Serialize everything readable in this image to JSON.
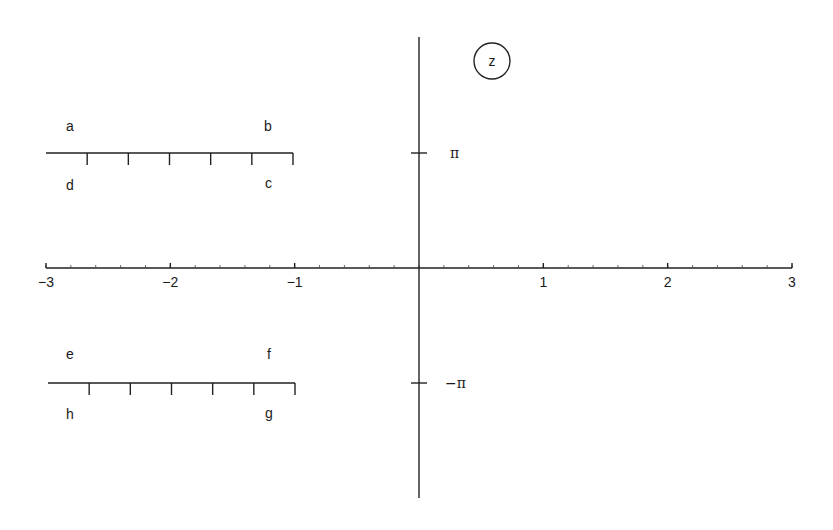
{
  "plane_label": "z",
  "x_axis": {
    "ticks": [
      {
        "value": -3,
        "label": "−3",
        "x": 46
      },
      {
        "value": -2,
        "label": "−2",
        "x": 170
      },
      {
        "value": -1,
        "label": "−1",
        "x": 294
      },
      {
        "value": 1,
        "label": "1",
        "x": 543
      },
      {
        "value": 2,
        "label": "2",
        "x": 668
      },
      {
        "value": 3,
        "label": "3",
        "x": 792
      }
    ],
    "minor_step": 0.2
  },
  "y_axis": {
    "ticks": [
      {
        "label": "π",
        "y": 153
      },
      {
        "label": "−π",
        "y": 383
      }
    ]
  },
  "upper_segment": {
    "corner_labels": {
      "top_left": "a",
      "top_right": "b",
      "bottom_left": "d",
      "bottom_right": "c"
    },
    "x_from": -3,
    "x_to": -1,
    "y": "π"
  },
  "lower_segment": {
    "corner_labels": {
      "top_left": "e",
      "top_right": "f",
      "bottom_left": "h",
      "bottom_right": "g"
    },
    "x_from": -3,
    "x_to": -1,
    "y": "−π"
  }
}
